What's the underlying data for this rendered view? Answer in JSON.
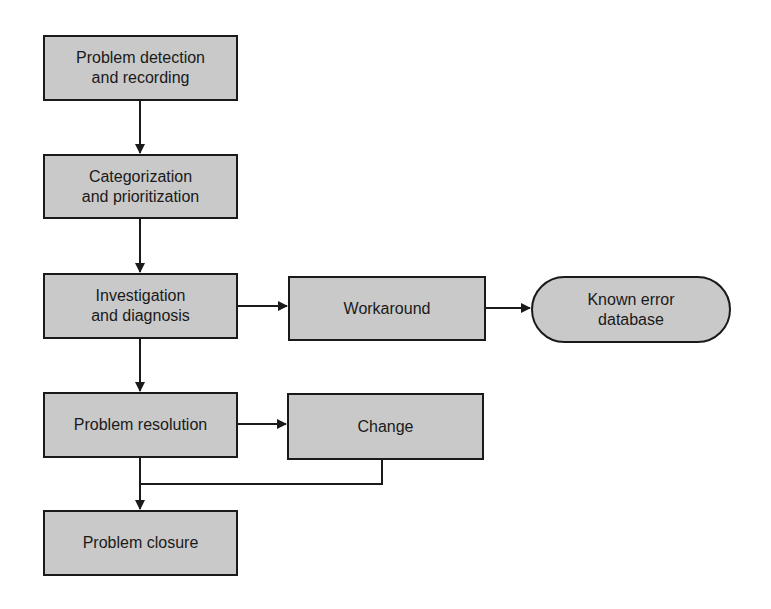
{
  "diagram": {
    "type": "flowchart",
    "colors": {
      "node_fill": "#c9c9c9",
      "stroke": "#1a1a1a",
      "background": "#ffffff"
    },
    "nodes": [
      {
        "id": "detection",
        "label": "Problem detection\nand recording",
        "shape": "rect"
      },
      {
        "id": "categorization",
        "label": "Categorization\nand prioritization",
        "shape": "rect"
      },
      {
        "id": "investigation",
        "label": "Investigation\nand diagnosis",
        "shape": "rect"
      },
      {
        "id": "workaround",
        "label": "Workaround",
        "shape": "rect"
      },
      {
        "id": "known_error",
        "label": "Known error\ndatabase",
        "shape": "rounded"
      },
      {
        "id": "resolution",
        "label": "Problem resolution",
        "shape": "rect"
      },
      {
        "id": "change",
        "label": "Change",
        "shape": "rect"
      },
      {
        "id": "closure",
        "label": "Problem closure",
        "shape": "rect"
      }
    ],
    "edges": [
      {
        "from": "detection",
        "to": "categorization"
      },
      {
        "from": "categorization",
        "to": "investigation"
      },
      {
        "from": "investigation",
        "to": "workaround"
      },
      {
        "from": "workaround",
        "to": "known_error"
      },
      {
        "from": "investigation",
        "to": "resolution"
      },
      {
        "from": "resolution",
        "to": "change"
      },
      {
        "from": "resolution",
        "to": "closure"
      },
      {
        "from": "change",
        "to": "closure"
      }
    ]
  }
}
